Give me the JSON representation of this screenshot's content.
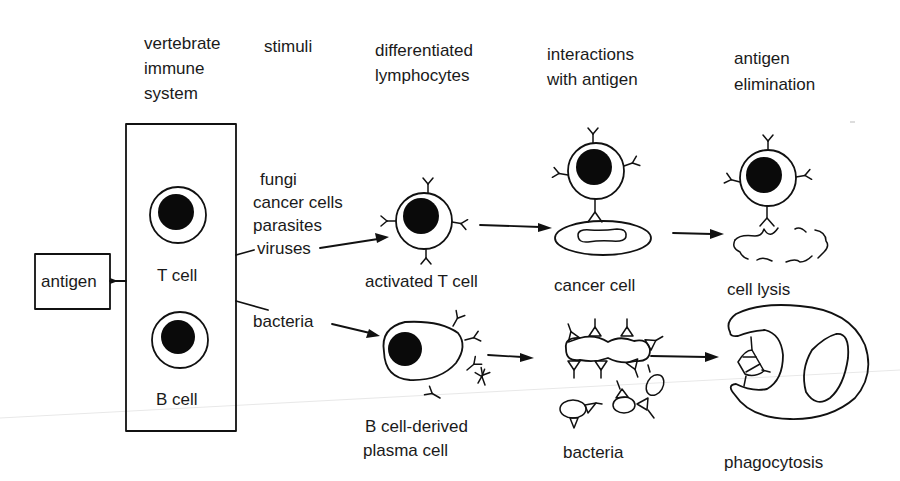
{
  "column_headers": {
    "col1": [
      "vertebrate",
      "immune",
      "system"
    ],
    "col2": [
      "stimuli"
    ],
    "col3": [
      "differentiated",
      "lymphocytes"
    ],
    "col4": [
      "interactions",
      "with antigen"
    ],
    "col5": [
      "antigen",
      "elimination"
    ]
  },
  "antigen_box": {
    "label": "antigen"
  },
  "immune_system_box": {
    "t_cell_label": "T cell",
    "b_cell_label": "B cell"
  },
  "stimuli": {
    "t_cell_stimuli": [
      "fungi",
      "cancer cells",
      "parasites",
      "viruses"
    ],
    "b_cell_stimuli": [
      "bacteria"
    ]
  },
  "t_cell_pathway": {
    "differentiated_label": "activated T cell",
    "interaction_label": "cancer cell",
    "elimination_label": "cell lysis"
  },
  "b_cell_pathway": {
    "differentiated_label": [
      "B cell-derived",
      "plasma cell"
    ],
    "interaction_label": "bacteria",
    "elimination_label": "phagocytosis"
  },
  "colors": {
    "ink": "#111111",
    "background": "#ffffff"
  }
}
